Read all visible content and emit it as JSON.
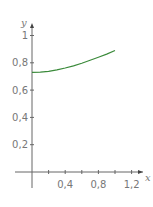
{
  "chart_data": {
    "type": "line",
    "title": "",
    "xlabel": "x",
    "ylabel": "y",
    "xlim": [
      -0.4,
      1.4
    ],
    "ylim": [
      -0.15,
      1.1
    ],
    "grid": false,
    "x_ticks": [
      0.2,
      0.4,
      0.6,
      0.8,
      1.0,
      1.2
    ],
    "x_tick_labels": [
      "0,4",
      "0,8",
      "1,2"
    ],
    "y_ticks": [
      0.2,
      0.4,
      0.6,
      0.8,
      1
    ],
    "y_tick_labels": [
      "0,2",
      "0,4",
      "0,6",
      "0,8",
      "1"
    ],
    "series": [
      {
        "name": "curve",
        "color": "#3a8a3a",
        "x": [
          0,
          0.1,
          0.2,
          0.3,
          0.4,
          0.5,
          0.6,
          0.7,
          0.8,
          0.9,
          1.0
        ],
        "y": [
          0.73,
          0.732,
          0.738,
          0.748,
          0.762,
          0.778,
          0.797,
          0.818,
          0.84,
          0.864,
          0.89
        ]
      }
    ]
  }
}
